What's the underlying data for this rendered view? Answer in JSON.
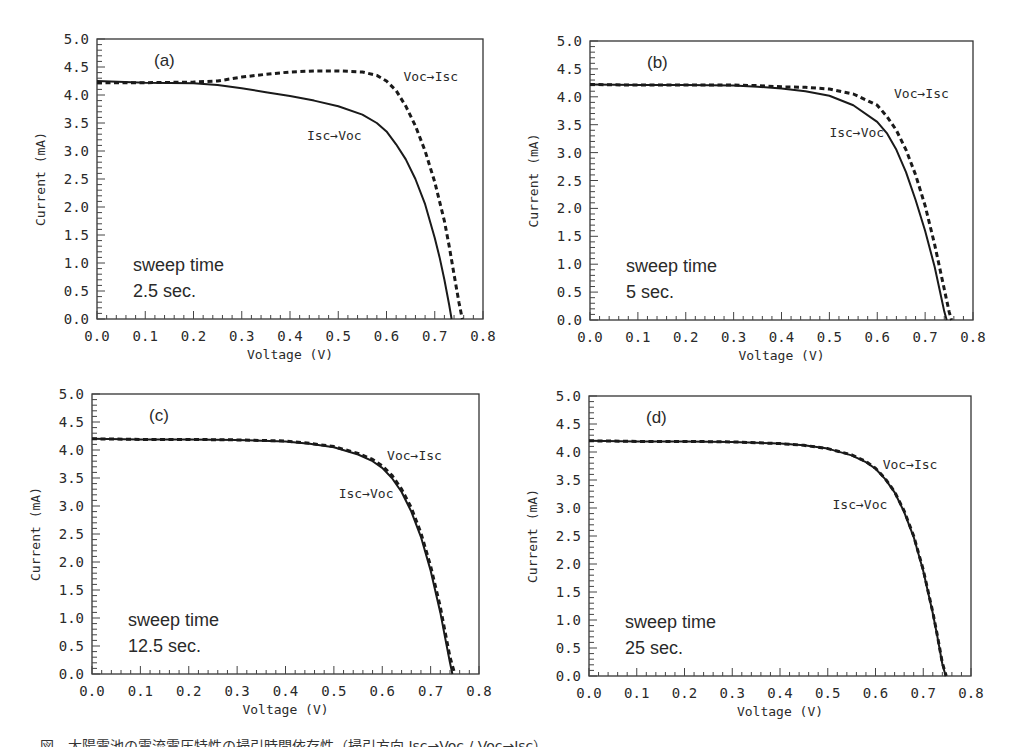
{
  "figure": {
    "caption_fragment": "図　太陽電池の電流電圧特性の掃引時間依存性（掃引方向 Isc→Voc / Voc→Isc）"
  },
  "chart_data": [
    {
      "type": "line",
      "panel": "(a)",
      "title": "",
      "xlabel": "Voltage (V)",
      "ylabel": "Current (mA)",
      "xlim": [
        0.0,
        0.8
      ],
      "ylim": [
        0.0,
        5.0
      ],
      "x_ticks": [
        "0.0",
        "0.1",
        "0.2",
        "0.3",
        "0.4",
        "0.5",
        "0.6",
        "0.7",
        "0.8"
      ],
      "y_ticks": [
        "0.0",
        "0.5",
        "1.0",
        "1.5",
        "2.0",
        "2.5",
        "3.0",
        "3.5",
        "4.0",
        "4.5",
        "5.0"
      ],
      "grid": false,
      "annotation": [
        "sweep time",
        "2.5 sec."
      ],
      "series": [
        {
          "name": "Isc→Voc",
          "style": "solid",
          "x": [
            0.0,
            0.1,
            0.2,
            0.25,
            0.3,
            0.35,
            0.4,
            0.45,
            0.5,
            0.55,
            0.58,
            0.6,
            0.62,
            0.64,
            0.66,
            0.68,
            0.7,
            0.71,
            0.72,
            0.73,
            0.735
          ],
          "y": [
            4.25,
            4.22,
            4.21,
            4.18,
            4.12,
            4.05,
            3.98,
            3.9,
            3.8,
            3.65,
            3.5,
            3.35,
            3.12,
            2.85,
            2.5,
            2.05,
            1.45,
            1.1,
            0.7,
            0.25,
            0.0
          ]
        },
        {
          "name": "Voc→Isc",
          "style": "dashed",
          "x": [
            0.0,
            0.1,
            0.2,
            0.25,
            0.3,
            0.35,
            0.4,
            0.45,
            0.5,
            0.55,
            0.58,
            0.6,
            0.62,
            0.64,
            0.66,
            0.68,
            0.7,
            0.72,
            0.73,
            0.74,
            0.75,
            0.757
          ],
          "y": [
            4.22,
            4.22,
            4.23,
            4.25,
            4.32,
            4.37,
            4.41,
            4.43,
            4.43,
            4.41,
            4.35,
            4.25,
            4.08,
            3.8,
            3.45,
            3.0,
            2.45,
            1.75,
            1.3,
            0.8,
            0.3,
            0.0
          ]
        }
      ],
      "labels": [
        {
          "text": "Voc→Isc",
          "x": 0.635,
          "y": 4.25
        },
        {
          "text": "Isc→Voc",
          "x": 0.435,
          "y": 3.2
        }
      ]
    },
    {
      "type": "line",
      "panel": "(b)",
      "title": "",
      "xlabel": "Voltage (V)",
      "ylabel": "Current (mA)",
      "xlim": [
        0.0,
        0.8
      ],
      "ylim": [
        0.0,
        5.0
      ],
      "x_ticks": [
        "0.0",
        "0.1",
        "0.2",
        "0.3",
        "0.4",
        "0.5",
        "0.6",
        "0.7",
        "0.8"
      ],
      "y_ticks": [
        "0.0",
        "0.5",
        "1.0",
        "1.5",
        "2.0",
        "2.5",
        "3.0",
        "3.5",
        "4.0",
        "4.5",
        "5.0"
      ],
      "grid": false,
      "annotation": [
        "sweep time",
        "5 sec."
      ],
      "series": [
        {
          "name": "Isc→Voc",
          "style": "solid",
          "x": [
            0.0,
            0.1,
            0.2,
            0.3,
            0.35,
            0.4,
            0.45,
            0.5,
            0.55,
            0.6,
            0.62,
            0.64,
            0.66,
            0.68,
            0.7,
            0.72,
            0.73,
            0.74,
            0.745
          ],
          "y": [
            4.22,
            4.21,
            4.21,
            4.2,
            4.18,
            4.15,
            4.1,
            4.02,
            3.85,
            3.55,
            3.35,
            3.05,
            2.65,
            2.15,
            1.6,
            0.95,
            0.55,
            0.15,
            0.0
          ]
        },
        {
          "name": "Voc→Isc",
          "style": "dashed",
          "x": [
            0.0,
            0.1,
            0.2,
            0.3,
            0.35,
            0.4,
            0.45,
            0.5,
            0.55,
            0.6,
            0.62,
            0.64,
            0.66,
            0.68,
            0.7,
            0.72,
            0.73,
            0.74,
            0.75,
            0.755
          ],
          "y": [
            4.22,
            4.21,
            4.21,
            4.21,
            4.2,
            4.18,
            4.17,
            4.14,
            4.05,
            3.85,
            3.65,
            3.4,
            3.05,
            2.6,
            2.05,
            1.35,
            0.95,
            0.55,
            0.15,
            0.0
          ]
        }
      ],
      "labels": [
        {
          "text": "Voc→Isc",
          "x": 0.635,
          "y": 3.98
        },
        {
          "text": "Isc→Voc",
          "x": 0.5,
          "y": 3.28
        }
      ]
    },
    {
      "type": "line",
      "panel": "(c)",
      "title": "",
      "xlabel": "Voltage (V)",
      "ylabel": "Current (mA)",
      "xlim": [
        0.0,
        0.8
      ],
      "ylim": [
        0.0,
        5.0
      ],
      "x_ticks": [
        "0.0",
        "0.1",
        "0.2",
        "0.3",
        "0.4",
        "0.5",
        "0.6",
        "0.7",
        "0.8"
      ],
      "y_ticks": [
        "0.0",
        "0.5",
        "1.0",
        "1.5",
        "2.0",
        "2.5",
        "3.0",
        "3.5",
        "4.0",
        "4.5",
        "5.0"
      ],
      "grid": false,
      "annotation": [
        "sweep time",
        "12.5 sec."
      ],
      "series": [
        {
          "name": "Isc→Voc",
          "style": "solid",
          "x": [
            0.0,
            0.1,
            0.2,
            0.3,
            0.4,
            0.45,
            0.5,
            0.55,
            0.58,
            0.6,
            0.62,
            0.64,
            0.66,
            0.68,
            0.7,
            0.72,
            0.73,
            0.74,
            0.745
          ],
          "y": [
            4.2,
            4.19,
            4.19,
            4.18,
            4.15,
            4.11,
            4.05,
            3.92,
            3.8,
            3.68,
            3.5,
            3.25,
            2.9,
            2.45,
            1.85,
            1.1,
            0.65,
            0.2,
            0.0
          ]
        },
        {
          "name": "Voc→Isc",
          "style": "dashed",
          "x": [
            0.0,
            0.1,
            0.2,
            0.3,
            0.4,
            0.45,
            0.5,
            0.55,
            0.58,
            0.6,
            0.62,
            0.64,
            0.66,
            0.68,
            0.7,
            0.72,
            0.73,
            0.74,
            0.75
          ],
          "y": [
            4.2,
            4.19,
            4.19,
            4.18,
            4.16,
            4.12,
            4.06,
            3.94,
            3.83,
            3.72,
            3.55,
            3.3,
            2.97,
            2.52,
            1.93,
            1.2,
            0.75,
            0.3,
            0.0
          ]
        }
      ],
      "labels": [
        {
          "text": "Voc→Isc",
          "x": 0.61,
          "y": 3.83
        },
        {
          "text": "Isc→Voc",
          "x": 0.51,
          "y": 3.15
        }
      ]
    },
    {
      "type": "line",
      "panel": "(d)",
      "title": "",
      "xlabel": "Voltage (V)",
      "ylabel": "Current (mA)",
      "xlim": [
        0.0,
        0.8
      ],
      "ylim": [
        0.0,
        5.0
      ],
      "x_ticks": [
        "0.0",
        "0.1",
        "0.2",
        "0.3",
        "0.4",
        "0.5",
        "0.6",
        "0.7",
        "0.8"
      ],
      "y_ticks": [
        "0.0",
        "0.5",
        "1.0",
        "1.5",
        "2.0",
        "2.5",
        "3.0",
        "3.5",
        "4.0",
        "4.5",
        "5.0"
      ],
      "grid": false,
      "annotation": [
        "sweep time",
        "25 sec."
      ],
      "series": [
        {
          "name": "Isc→Voc",
          "style": "solid",
          "x": [
            0.0,
            0.1,
            0.2,
            0.3,
            0.4,
            0.45,
            0.5,
            0.55,
            0.58,
            0.6,
            0.62,
            0.64,
            0.66,
            0.68,
            0.7,
            0.72,
            0.73,
            0.74,
            0.747
          ],
          "y": [
            4.2,
            4.19,
            4.19,
            4.18,
            4.15,
            4.12,
            4.06,
            3.94,
            3.82,
            3.7,
            3.52,
            3.28,
            2.93,
            2.48,
            1.88,
            1.12,
            0.68,
            0.22,
            0.0
          ]
        },
        {
          "name": "Voc→Isc",
          "style": "dashed",
          "x": [
            0.0,
            0.1,
            0.2,
            0.3,
            0.4,
            0.45,
            0.5,
            0.55,
            0.58,
            0.6,
            0.62,
            0.64,
            0.66,
            0.68,
            0.7,
            0.72,
            0.73,
            0.74,
            0.748
          ],
          "y": [
            4.2,
            4.19,
            4.19,
            4.18,
            4.15,
            4.12,
            4.06,
            3.95,
            3.83,
            3.71,
            3.53,
            3.29,
            2.95,
            2.5,
            1.9,
            1.14,
            0.7,
            0.24,
            0.0
          ]
        }
      ],
      "labels": [
        {
          "text": "Voc→Isc",
          "x": 0.615,
          "y": 3.7
        },
        {
          "text": "Isc→Voc",
          "x": 0.51,
          "y": 2.98
        }
      ]
    }
  ]
}
